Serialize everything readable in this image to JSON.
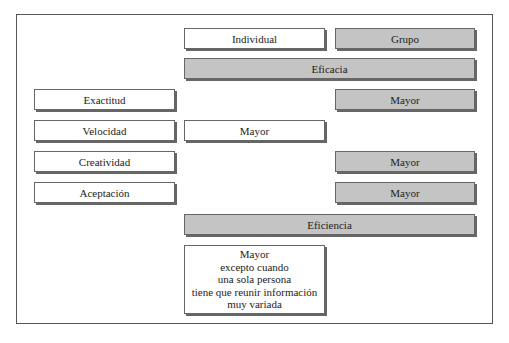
{
  "diagram": {
    "headers": {
      "individual": "Individual",
      "group": "Grupo"
    },
    "sections": {
      "efficacy": "Eficacia",
      "efficiency": "Eficiencia"
    },
    "criteria": [
      {
        "label": "Exactitud",
        "winner": "group",
        "value": "Mayor"
      },
      {
        "label": "Velocidad",
        "winner": "individual",
        "value": "Mayor"
      },
      {
        "label": "Creatividad",
        "winner": "group",
        "value": "Mayor"
      },
      {
        "label": "Aceptación",
        "winner": "group",
        "value": "Mayor"
      }
    ],
    "efficiency_note": {
      "lines": [
        "Mayor",
        "excepto cuando",
        "una sola persona",
        "tiene que reunir información",
        "muy variada"
      ]
    }
  },
  "colors": {
    "gray_fill": "#c4c4c4",
    "border": "#666666",
    "frame": "#555555"
  }
}
